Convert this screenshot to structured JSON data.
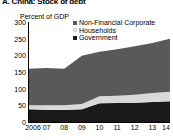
{
  "panel": {
    "title": "A. China: Stock of debt"
  },
  "chart_data": {
    "type": "area",
    "stacked": true,
    "title": "A. China: Stock of debt",
    "subtitle": "",
    "xlabel": "",
    "ylabel": "Percent of GDP",
    "axis_title": "Percent of GDP",
    "categories": [
      "2006",
      "07",
      "08",
      "09",
      "10",
      "11",
      "12",
      "13",
      "14"
    ],
    "x": [
      2006,
      2007,
      2008,
      2009,
      2010,
      2011,
      2012,
      2013,
      2014
    ],
    "xtick_labels": [
      "2006",
      "07",
      "08",
      "09",
      "10",
      "11",
      "12",
      "13",
      "14"
    ],
    "ytick_labels": [
      "0",
      "50",
      "100",
      "150",
      "200",
      "250",
      "300"
    ],
    "yticks": [
      0,
      50,
      100,
      150,
      200,
      250,
      300
    ],
    "ylim": [
      0,
      300
    ],
    "grid": false,
    "legend_position": "top-right",
    "series": [
      {
        "name": "Government",
        "color": "#1a1a1a",
        "values": [
          38,
          37,
          36,
          38,
          56,
          57,
          58,
          60,
          62
        ]
      },
      {
        "name": "Households",
        "color": "#d9d9d9",
        "values": [
          12,
          13,
          14,
          16,
          21,
          22,
          24,
          27,
          29
        ]
      },
      {
        "name": "Non-Financial Corporate",
        "color": "#595959",
        "values": [
          110,
          112,
          110,
          145,
          134,
          139,
          145,
          150,
          159
        ]
      }
    ],
    "totals": [
      160,
      162,
      160,
      199,
      211,
      218,
      227,
      237,
      250
    ],
    "legend_entries": [
      "Non-Financial Corporate",
      "Households",
      "Government"
    ]
  },
  "colors": {
    "non_financial_corporate": "#595959",
    "households": "#d9d9d9",
    "government": "#1a1a1a",
    "axis": "#000000",
    "background": "#ffffff"
  }
}
